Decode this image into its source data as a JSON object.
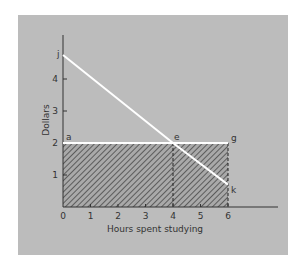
{
  "chart_data": {
    "type": "line",
    "title": "",
    "xlabel": "Hours spent studying",
    "ylabel": "Dollars",
    "x_ticks": [
      "0",
      "1",
      "2",
      "3",
      "4",
      "5",
      "6"
    ],
    "y_ticks": [
      "1",
      "2",
      "3",
      "4"
    ],
    "xlim": [
      0,
      6.5
    ],
    "ylim": [
      0,
      5.2
    ],
    "grid": false,
    "series": [
      {
        "name": "Declining line j-k",
        "color": "#ffffff",
        "points": [
          [
            0,
            4.75
          ],
          [
            4,
            2
          ],
          [
            6,
            0.7
          ]
        ]
      },
      {
        "name": "Horizontal line a-g",
        "color": "#ffffff",
        "points": [
          [
            0,
            2
          ],
          [
            6,
            2
          ]
        ]
      }
    ],
    "shaded_region": {
      "x": [
        0,
        6
      ],
      "y": [
        0,
        2
      ],
      "pattern": "diagonal hatch"
    },
    "dashed_lines": [
      {
        "x": 4,
        "from_y": 0,
        "to_y": 2
      },
      {
        "x": 6,
        "from_y": 0,
        "to_y": 2
      }
    ],
    "point_labels": [
      {
        "label": "j",
        "x": 0,
        "y": 4.75
      },
      {
        "label": "a",
        "x": 0,
        "y": 2
      },
      {
        "label": "e",
        "x": 4,
        "y": 2
      },
      {
        "label": "g",
        "x": 6,
        "y": 2
      },
      {
        "label": "k",
        "x": 6,
        "y": 0.7
      }
    ]
  }
}
